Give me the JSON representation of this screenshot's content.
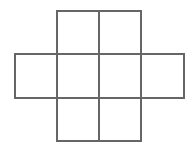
{
  "figure": {
    "name": "cross-shaped-square-net",
    "background_color": "#ffffff",
    "line_color": "#666666",
    "line_width": 2,
    "canvas": {
      "width": 194,
      "height": 148
    },
    "grid": {
      "x_lines": [
        15,
        57,
        99,
        141,
        184
      ],
      "y_lines": [
        11,
        54,
        98,
        141
      ],
      "columns": 4,
      "rows": 3,
      "cell_width": 42,
      "cell_height": 43
    },
    "cells": [
      {
        "id": "cell-top-left",
        "col": 1,
        "row": 0,
        "x": 57,
        "y": 11,
        "w": 42,
        "h": 43
      },
      {
        "id": "cell-top-right",
        "col": 2,
        "row": 0,
        "x": 99,
        "y": 11,
        "w": 42,
        "h": 43
      },
      {
        "id": "cell-middle-1",
        "col": 0,
        "row": 1,
        "x": 15,
        "y": 54,
        "w": 42,
        "h": 44
      },
      {
        "id": "cell-middle-2",
        "col": 1,
        "row": 1,
        "x": 57,
        "y": 54,
        "w": 42,
        "h": 44
      },
      {
        "id": "cell-middle-3",
        "col": 2,
        "row": 1,
        "x": 99,
        "y": 54,
        "w": 42,
        "h": 44
      },
      {
        "id": "cell-middle-4",
        "col": 3,
        "row": 1,
        "x": 141,
        "y": 54,
        "w": 43,
        "h": 44
      },
      {
        "id": "cell-bottom-left",
        "col": 1,
        "row": 2,
        "x": 57,
        "y": 98,
        "w": 42,
        "h": 43
      },
      {
        "id": "cell-bottom-right",
        "col": 2,
        "row": 2,
        "x": 99,
        "y": 98,
        "w": 42,
        "h": 43
      }
    ],
    "segments": [
      {
        "id": "seg-top-edge",
        "x1": 57,
        "y1": 11,
        "x2": 141,
        "y2": 11
      },
      {
        "id": "seg-upper-horizontal",
        "x1": 15,
        "y1": 54,
        "x2": 184,
        "y2": 54
      },
      {
        "id": "seg-lower-horizontal",
        "x1": 15,
        "y1": 98,
        "x2": 184,
        "y2": 98
      },
      {
        "id": "seg-bottom-edge",
        "x1": 57,
        "y1": 141,
        "x2": 141,
        "y2": 141
      },
      {
        "id": "seg-left-edge",
        "x1": 15,
        "y1": 54,
        "x2": 15,
        "y2": 98
      },
      {
        "id": "seg-left-inner-vertical",
        "x1": 57,
        "y1": 11,
        "x2": 57,
        "y2": 141
      },
      {
        "id": "seg-center-vertical",
        "x1": 99,
        "y1": 11,
        "x2": 99,
        "y2": 141
      },
      {
        "id": "seg-right-inner-vertical",
        "x1": 141,
        "y1": 11,
        "x2": 141,
        "y2": 141
      },
      {
        "id": "seg-right-edge",
        "x1": 184,
        "y1": 54,
        "x2": 184,
        "y2": 98
      }
    ]
  }
}
